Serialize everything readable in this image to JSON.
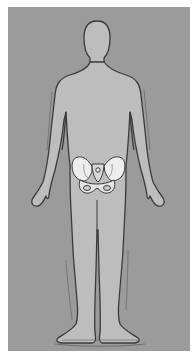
{
  "figure": {
    "highlighted_region": "pelvis",
    "colors": {
      "background": "#ffffff",
      "panel": "#9b9b9b",
      "body_fill": "#bdbdbd",
      "outline": "#3c3c3c",
      "bone_fill": "#eeeeee",
      "bone_shade": "#d4d4d4"
    }
  }
}
